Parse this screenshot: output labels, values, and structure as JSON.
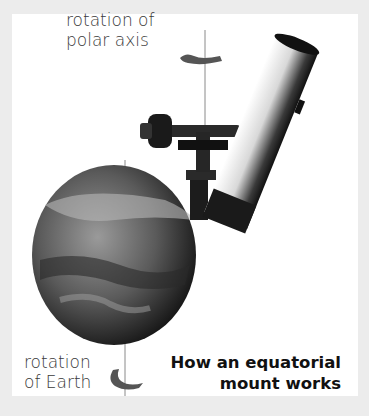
{
  "diagram": {
    "title_line1": "How an equatorial",
    "title_line2": "mount works",
    "labels": {
      "polar_line1": "rotation of",
      "polar_line2": "polar axis",
      "earth_line1": "rotation",
      "earth_line2": "of Earth"
    },
    "elements": [
      "telescope-tube",
      "equatorial-mount",
      "earth-globe",
      "polar-axis-line",
      "earth-axis-line",
      "rotation-arrow-polar",
      "rotation-arrow-earth"
    ],
    "colors": {
      "background": "#ececec",
      "panel": "#ffffff",
      "text": "#3a3a3a",
      "title": "#111111",
      "axis": "#8a8a8a",
      "arrow": "#555555"
    }
  }
}
